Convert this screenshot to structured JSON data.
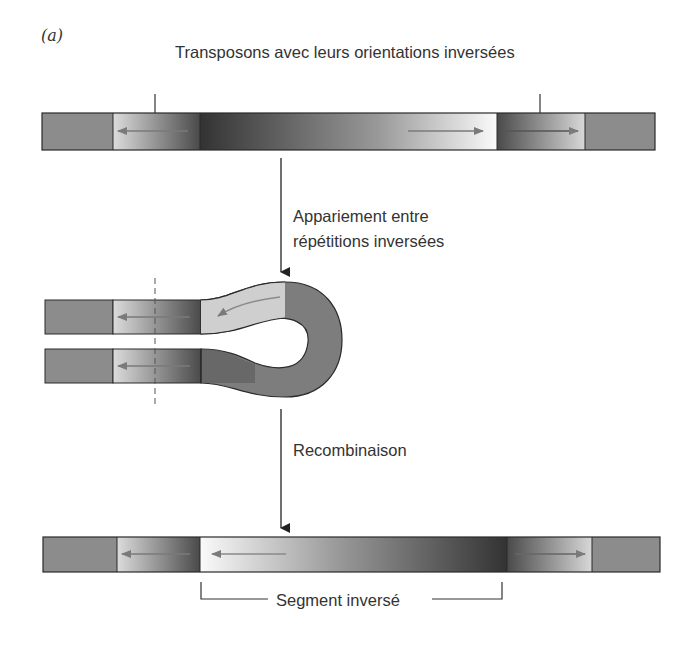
{
  "figure": {
    "panel_label": "(a)",
    "top_caption": "Transposons avec leurs orientations inversées",
    "step1_label_line1": "Appariement entre",
    "step1_label_line2": "répétitions inversées",
    "step2_label": "Recombinaison",
    "bottom_bracket_label": "Segment inversé"
  },
  "colors": {
    "flat_gray": "#8c8c8c",
    "dark": "#3a3a3a",
    "light": "#e8e8e8",
    "white": "#f8f8f8",
    "outline": "#2a2a2a",
    "arrow_gray": "#777777"
  }
}
